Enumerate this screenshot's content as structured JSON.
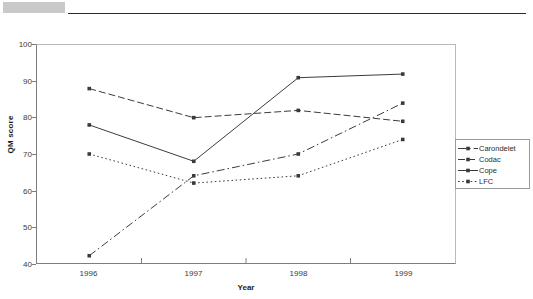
{
  "header": {
    "band_color": "#c9c9c9",
    "rule_color": "#2b2b2b"
  },
  "chart_data": {
    "type": "line",
    "title": "",
    "xlabel": "Year",
    "ylabel": "QM score",
    "categories": [
      "1996",
      "1997",
      "1998",
      "1999"
    ],
    "ylim": [
      40,
      100
    ],
    "yticks": [
      40,
      50,
      60,
      70,
      80,
      90,
      100
    ],
    "grid": false,
    "legend_position": "right",
    "series": [
      {
        "name": "Carondelet",
        "values": [
          42,
          64,
          70,
          84
        ],
        "line_style": "dash-dot",
        "marker": "square",
        "color": "#3a3a3a"
      },
      {
        "name": "Codac",
        "values": [
          88,
          80,
          82,
          79
        ],
        "line_style": "dashed",
        "marker": "square",
        "color": "#3a3a3a"
      },
      {
        "name": "Cope",
        "values": [
          78,
          68,
          91,
          92
        ],
        "line_style": "solid",
        "marker": "square",
        "color": "#3a3a3a"
      },
      {
        "name": "LFC",
        "values": [
          70,
          62,
          64,
          74
        ],
        "line_style": "dotted",
        "marker": "square",
        "color": "#3a3a3a"
      }
    ]
  },
  "legend": {
    "entries": [
      "Carondelet",
      "Codac",
      "Cope",
      "LFC"
    ]
  }
}
